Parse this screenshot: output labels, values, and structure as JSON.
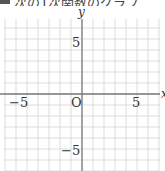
{
  "header": {
    "badge": "",
    "text": "次の1次関数のグラフ"
  },
  "chart_data": {
    "type": "coordinate-grid",
    "title": "",
    "xlabel": "x",
    "ylabel": "y",
    "xlim": [
      -7,
      7
    ],
    "ylim": [
      -7,
      7
    ],
    "grid": true,
    "grid_step": 1,
    "origin_label": "O",
    "x_tick_labels": [
      {
        "value": -5,
        "label": "−5"
      },
      {
        "value": 5,
        "label": "5"
      }
    ],
    "y_tick_labels": [
      {
        "value": 5,
        "label": "5"
      },
      {
        "value": -5,
        "label": "−5"
      }
    ],
    "series": []
  },
  "labels": {
    "x_axis": "x",
    "y_axis": "y",
    "origin": "O",
    "x_neg5": "−5",
    "x_pos5": "5",
    "y_pos5": "5",
    "y_neg5": "−5"
  },
  "colors": {
    "grid": "#d4d4d4",
    "axis": "#7a7a7a",
    "text": "#333333"
  }
}
